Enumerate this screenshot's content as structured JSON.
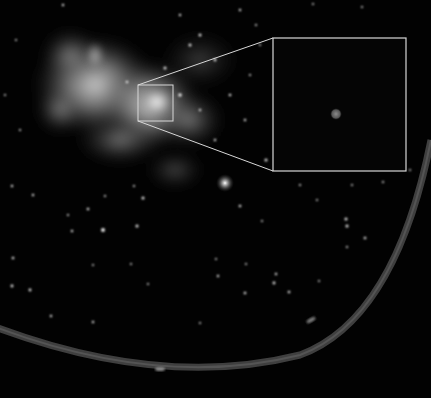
{
  "image": {
    "description": "Monochrome astronomical image of a bright diffuse nebulous region (galactic center) against a dark star field, with a square highlight box magnified into an inset panel on the right showing a single faint point source; a curved bright ring arc sweeps across the lower part of the frame.",
    "width": 431,
    "height": 398
  },
  "colors": {
    "background": "#020202",
    "nebula": "#bdbdbd",
    "callout_lines": "#d8d8d8",
    "ring": "#5a5a5a",
    "inset_background": "#050505",
    "inset_source": "#6e6e6e"
  },
  "highlight_box": {
    "x": 138,
    "y": 85,
    "w": 35,
    "h": 36
  },
  "inset": {
    "x": 273,
    "y": 38,
    "w": 133,
    "h": 133,
    "source": {
      "cx": 336,
      "cy": 114,
      "r": 6
    }
  },
  "callout_lines": [
    {
      "x1": 138,
      "y1": 85,
      "x2": 273,
      "y2": 38
    },
    {
      "x1": 138,
      "y1": 121,
      "x2": 273,
      "y2": 171
    }
  ],
  "bright_star": {
    "cx": 225,
    "cy": 183
  }
}
